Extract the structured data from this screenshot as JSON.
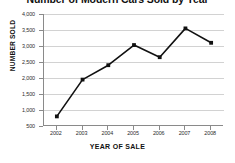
{
  "chart_data": {
    "type": "line",
    "title": "Number of Modern Cars Sold by Year",
    "xlabel": "YEAR OF SALE",
    "ylabel": "NUMBER SOLD",
    "categories": [
      "2002",
      "2003",
      "2004",
      "2005",
      "2006",
      "2007",
      "2008"
    ],
    "values": [
      800,
      1950,
      2400,
      3030,
      2650,
      3550,
      3100
    ],
    "series": [
      {
        "name": "Cars sold",
        "values": [
          800,
          1950,
          2400,
          3030,
          2650,
          3550,
          3100
        ]
      }
    ],
    "ylim": [
      500,
      4000
    ],
    "yticks": [
      500,
      1000,
      1500,
      2000,
      2500,
      3000,
      3500,
      4000
    ],
    "ytick_labels": [
      "500",
      "1,000",
      "1,500",
      "2,000",
      "2,500",
      "3,000",
      "3,500",
      "4,000"
    ],
    "xtick_labels": [
      "2002",
      "2003",
      "2004",
      "2005",
      "2006",
      "2007",
      "2008"
    ],
    "grid": true,
    "legend": false,
    "line_color": "#111111",
    "marker": "square",
    "marker_color": "#111111"
  }
}
